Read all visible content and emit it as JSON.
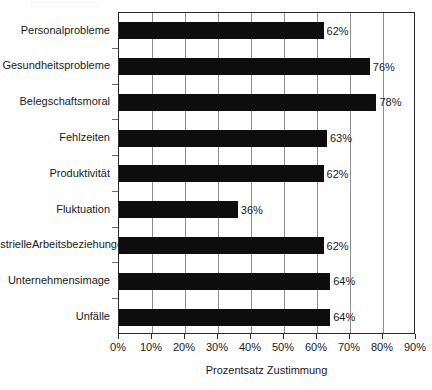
{
  "chart_data": {
    "type": "bar",
    "orientation": "horizontal",
    "title": "",
    "xlabel": "Prozentsatz Zustimmung",
    "ylabel": "",
    "xlim": [
      0,
      90
    ],
    "grid": true,
    "legend": "none",
    "categories": [
      "Personalprobleme",
      "Gesundheitsprobleme",
      "Belegschaftsmoral",
      "Fehlzeiten",
      "Produktivität",
      "Fluktuation",
      "Industrielle Arbeitsbeziehungen",
      "Unternehmensimage",
      "Unfälle"
    ],
    "values": [
      62,
      76,
      78,
      63,
      62,
      36,
      62,
      64,
      64
    ],
    "data_labels": [
      "62%",
      "76%",
      "78%",
      "63%",
      "62%",
      "36%",
      "62%",
      "64%",
      "64%"
    ],
    "xticks": [
      0,
      10,
      20,
      30,
      40,
      50,
      60,
      70,
      80,
      90
    ],
    "xtick_labels": [
      "0%",
      "10%",
      "20%",
      "30%",
      "40%",
      "50%",
      "60%",
      "70%",
      "80%",
      "90%"
    ],
    "bar_color": "#0d0d0d",
    "grid_color": "#8e8e8e",
    "axis_color": "#2b2b2b",
    "background": "#ffffff"
  },
  "rows": [
    {
      "label": "Personalprobleme",
      "label_line1": "Personalprobleme",
      "label_line2": "",
      "value": 62,
      "value_label": "62%"
    },
    {
      "label": "Gesundheitsprobleme",
      "label_line1": "Gesundheitsprobleme",
      "label_line2": "",
      "value": 76,
      "value_label": "76%"
    },
    {
      "label": "Belegschaftsmoral",
      "label_line1": "Belegschaftsmoral",
      "label_line2": "",
      "value": 78,
      "value_label": "78%"
    },
    {
      "label": "Fehlzeiten",
      "label_line1": "Fehlzeiten",
      "label_line2": "",
      "value": 63,
      "value_label": "63%"
    },
    {
      "label": "Produktivität",
      "label_line1": "Produktivität",
      "label_line2": "",
      "value": 62,
      "value_label": "62%"
    },
    {
      "label": "Fluktuation",
      "label_line1": "Fluktuation",
      "label_line2": "",
      "value": 36,
      "value_label": "36%"
    },
    {
      "label": "Industrielle Arbeitsbeziehungen",
      "label_line1": "Industrielle",
      "label_line2": "Arbeitsbeziehungen",
      "value": 62,
      "value_label": "62%"
    },
    {
      "label": "Unternehmensimage",
      "label_line1": "Unternehmensimage",
      "label_line2": "",
      "value": 64,
      "value_label": "64%"
    },
    {
      "label": "Unfälle",
      "label_line1": "Unfälle",
      "label_line2": "",
      "value": 64,
      "value_label": "64%"
    }
  ],
  "axis": {
    "title": "Prozentsatz Zustimmung",
    "ticks": [
      "0%",
      "10%",
      "20%",
      "30%",
      "40%",
      "50%",
      "60%",
      "70%",
      "80%",
      "90%"
    ]
  }
}
